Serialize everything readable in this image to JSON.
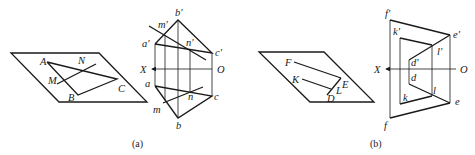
{
  "figure_a": {
    "caption": "(a)",
    "space_labels": {
      "A": "A",
      "B": "B",
      "C": "C",
      "M": "M",
      "N": "N"
    },
    "front_labels": {
      "a": "a'",
      "b": "b'",
      "c": "c'",
      "m": "m'",
      "n": "n'"
    },
    "top_labels": {
      "a": "a",
      "b": "b",
      "c": "c",
      "m": "m",
      "n": "n"
    },
    "axis": {
      "x": "X",
      "o": "O"
    }
  },
  "figure_b": {
    "caption": "(b)",
    "space_labels": {
      "F": "F",
      "K": "K",
      "E": "E",
      "D": "D",
      "L": "L"
    },
    "front_labels": {
      "f": "f'",
      "k": "k'",
      "e": "e'",
      "d": "d'",
      "l": "l'"
    },
    "top_labels": {
      "f": "f",
      "k": "k",
      "e": "e",
      "d": "d",
      "l": "l"
    },
    "axis": {
      "x": "X",
      "o": "O"
    }
  }
}
